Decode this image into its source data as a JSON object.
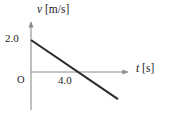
{
  "figure": {
    "background_color": "#ffffff",
    "axis_color": "#8c8c8c",
    "curve_color": "#2b2b2b",
    "text_color": "#1a1a1a",
    "origin_label": "O",
    "y_axis": {
      "variable": "v",
      "unit": "[m/s]",
      "tick_labels": [
        "2.0"
      ]
    },
    "x_axis": {
      "variable": "t",
      "unit": "[s]",
      "tick_labels": [
        "4.0"
      ]
    }
  },
  "chart_data": {
    "type": "line",
    "title": "",
    "xlabel": "t [s]",
    "ylabel": "v [m/s]",
    "xlim": [
      0,
      8.5
    ],
    "ylim": [
      -2.6,
      2.6
    ],
    "grid": false,
    "legend": null,
    "xticks": [
      4.0
    ],
    "xticklabels": [
      "4.0"
    ],
    "yticks": [
      2.0
    ],
    "yticklabels": [
      "2.0"
    ],
    "series": [
      {
        "name": "velocity",
        "x": [
          0,
          4.0,
          7.4
        ],
        "y": [
          2.0,
          0.0,
          -1.7
        ]
      }
    ],
    "annotations": [
      {
        "text": "O",
        "x": 0,
        "y": 0,
        "role": "origin"
      }
    ]
  }
}
